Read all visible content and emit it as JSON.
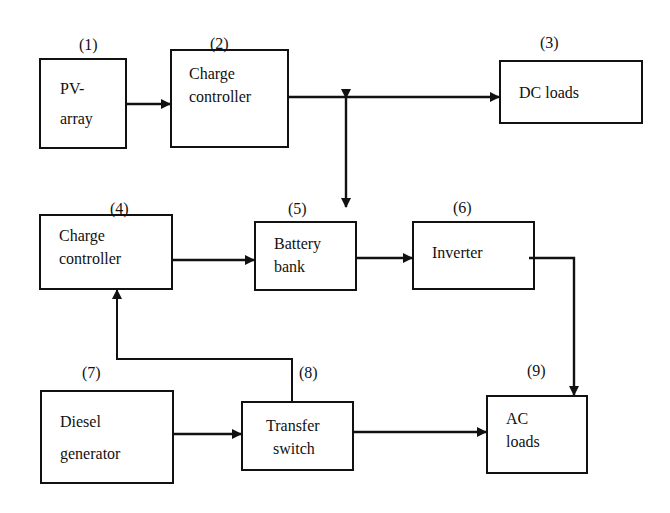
{
  "diagram": {
    "type": "block-diagram",
    "title": "",
    "colors": {
      "stroke": "#111111",
      "background": "#ffffff"
    },
    "blocks": [
      {
        "id": "1",
        "number": "(1)",
        "lines": [
          "PV-",
          "array"
        ]
      },
      {
        "id": "2",
        "number": "(2)",
        "lines": [
          "Charge",
          "controller"
        ]
      },
      {
        "id": "3",
        "number": "(3)",
        "lines": [
          "DC loads"
        ]
      },
      {
        "id": "4",
        "number": "(4)",
        "lines": [
          "Charge",
          "controller"
        ]
      },
      {
        "id": "5",
        "number": "(5)",
        "lines": [
          "Battery",
          "bank"
        ]
      },
      {
        "id": "6",
        "number": "(6)",
        "lines": [
          "Inverter"
        ]
      },
      {
        "id": "7",
        "number": "(7)",
        "lines": [
          "Diesel",
          "generator"
        ]
      },
      {
        "id": "8",
        "number": "(8)",
        "lines": [
          "Transfer",
          "switch"
        ]
      },
      {
        "id": "9",
        "number": "(9)",
        "lines": [
          "AC",
          "loads"
        ]
      }
    ],
    "connections": [
      {
        "from": "PV-array",
        "to": "Charge controller (2)",
        "direction": "forward"
      },
      {
        "from": "Charge controller (2)",
        "to": "DC loads",
        "direction": "forward"
      },
      {
        "from": "DC bus",
        "to": "Battery bank",
        "direction": "bidirectional"
      },
      {
        "from": "Charge controller (4)",
        "to": "Battery bank",
        "direction": "forward"
      },
      {
        "from": "Battery bank",
        "to": "Inverter",
        "direction": "forward"
      },
      {
        "from": "Inverter",
        "to": "AC loads",
        "direction": "forward"
      },
      {
        "from": "Diesel generator",
        "to": "Transfer switch",
        "direction": "forward"
      },
      {
        "from": "Transfer switch",
        "to": "AC loads",
        "direction": "forward"
      },
      {
        "from": "Transfer switch",
        "to": "Charge controller (4)",
        "direction": "forward"
      }
    ]
  }
}
